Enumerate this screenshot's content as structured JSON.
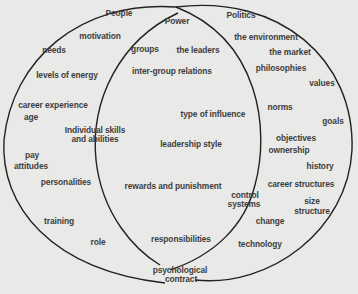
{
  "diagram": {
    "type": "venn",
    "colors": {
      "background": "#e9e9e7",
      "line": "#222222",
      "text": "#3e3e3e"
    },
    "circles": [
      {
        "name": "People",
        "label": "People"
      },
      {
        "name": "Politics",
        "label": "Politics"
      }
    ],
    "intersection_title": "Power",
    "labels": [
      {
        "id": "people",
        "text": "People",
        "x": 119,
        "y": 14
      },
      {
        "id": "motivation",
        "text": "motivation",
        "x": 100,
        "y": 37
      },
      {
        "id": "needs",
        "text": "needs",
        "x": 54,
        "y": 51
      },
      {
        "id": "levels-of-energy",
        "text": "levels of energy",
        "x": 67,
        "y": 76
      },
      {
        "id": "career-experience",
        "text": "career experience",
        "x": 53,
        "y": 106
      },
      {
        "id": "age",
        "text": "age",
        "x": 31,
        "y": 118
      },
      {
        "id": "individual-skills",
        "text": "Individual skills",
        "x": 95,
        "y": 131
      },
      {
        "id": "and-abilities",
        "text": "and abilities",
        "x": 95,
        "y": 140
      },
      {
        "id": "pay",
        "text": "pay",
        "x": 32,
        "y": 156
      },
      {
        "id": "attitudes",
        "text": "attitudes",
        "x": 31,
        "y": 167
      },
      {
        "id": "personalities",
        "text": "personalities",
        "x": 66,
        "y": 183
      },
      {
        "id": "training",
        "text": "training",
        "x": 59,
        "y": 222
      },
      {
        "id": "role",
        "text": "role",
        "x": 98,
        "y": 243
      },
      {
        "id": "power",
        "text": "Power",
        "x": 177,
        "y": 22
      },
      {
        "id": "groups",
        "text": "groups",
        "x": 145,
        "y": 50
      },
      {
        "id": "the-leaders",
        "text": "the leaders",
        "x": 198,
        "y": 51
      },
      {
        "id": "inter-group-relations",
        "text": "inter-group relations",
        "x": 172,
        "y": 72
      },
      {
        "id": "type-of-influence",
        "text": "type of influence",
        "x": 213,
        "y": 115
      },
      {
        "id": "leadership-style",
        "text": "leadership style",
        "x": 191,
        "y": 145
      },
      {
        "id": "rewards-and-punishment",
        "text": "rewards and punishment",
        "x": 173,
        "y": 187
      },
      {
        "id": "responsibilities",
        "text": "responsibilities",
        "x": 181,
        "y": 240
      },
      {
        "id": "psychological",
        "text": "psychological",
        "x": 180,
        "y": 271
      },
      {
        "id": "contract",
        "text": "contract",
        "x": 181,
        "y": 280
      },
      {
        "id": "politics",
        "text": "Politics",
        "x": 241,
        "y": 16
      },
      {
        "id": "the-environment",
        "text": "the environment",
        "x": 266,
        "y": 38
      },
      {
        "id": "the-market",
        "text": "the market",
        "x": 290,
        "y": 53
      },
      {
        "id": "philosophies",
        "text": "philosophies",
        "x": 281,
        "y": 69
      },
      {
        "id": "values",
        "text": "values",
        "x": 322,
        "y": 84
      },
      {
        "id": "norms",
        "text": "norms",
        "x": 280,
        "y": 108
      },
      {
        "id": "goals",
        "text": "goals",
        "x": 333,
        "y": 122
      },
      {
        "id": "objectives",
        "text": "objectives",
        "x": 296,
        "y": 139
      },
      {
        "id": "ownership",
        "text": "ownership",
        "x": 289,
        "y": 151
      },
      {
        "id": "history",
        "text": "history",
        "x": 320,
        "y": 167
      },
      {
        "id": "career-structures",
        "text": "career structures",
        "x": 301,
        "y": 185
      },
      {
        "id": "control",
        "text": "control",
        "x": 245,
        "y": 196
      },
      {
        "id": "systems",
        "text": "systems",
        "x": 244,
        "y": 205
      },
      {
        "id": "size",
        "text": "size",
        "x": 312,
        "y": 202
      },
      {
        "id": "structure",
        "text": "structure",
        "x": 312,
        "y": 212
      },
      {
        "id": "change",
        "text": "change",
        "x": 270,
        "y": 222
      },
      {
        "id": "technology",
        "text": "technology",
        "x": 260,
        "y": 245
      }
    ]
  }
}
